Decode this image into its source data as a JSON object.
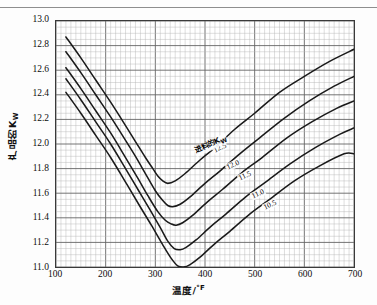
{
  "figure": {
    "yaxis_title": "产品的K",
    "yaxis_title_sub": "W",
    "xaxis_title": "温度/",
    "xaxis_title_unit": "°F",
    "series_header": "进料的K",
    "series_header_sub": "W"
  },
  "chart_data": {
    "type": "line",
    "title": "",
    "xlabel": "温度/°F",
    "ylabel": "产品的K_W",
    "xlim": [
      100,
      700
    ],
    "ylim": [
      11.0,
      13.0
    ],
    "xticks": [
      100,
      200,
      300,
      400,
      500,
      600,
      700
    ],
    "yticks": [
      11.0,
      11.2,
      11.4,
      11.6,
      11.8,
      12.0,
      12.2,
      12.4,
      12.6,
      12.8,
      13.0
    ],
    "xtick_labels": [
      "100",
      "200",
      "300",
      "400",
      "500",
      "600",
      "700"
    ],
    "ytick_labels": [
      "11.0",
      "11.2",
      "11.4",
      "11.6",
      "11.8",
      "12.0",
      "12.2",
      "12.4",
      "12.6",
      "12.8",
      "13.0"
    ],
    "grid": true,
    "grid_minor": true,
    "legend": "inline-labels",
    "legend_title": "进料的K_W",
    "series": [
      {
        "name": "12.5",
        "label": "12.5",
        "color": "#1a1a1a",
        "x": [
          120,
          150,
          180,
          210,
          240,
          260,
          280,
          295,
          305,
          315,
          325,
          340,
          360,
          390,
          420,
          460,
          500,
          550,
          600,
          650,
          700
        ],
        "values": [
          12.87,
          12.7,
          12.52,
          12.34,
          12.15,
          12.02,
          11.89,
          11.8,
          11.74,
          11.7,
          11.68,
          11.7,
          11.76,
          11.87,
          11.97,
          12.12,
          12.25,
          12.42,
          12.55,
          12.67,
          12.77
        ]
      },
      {
        "name": "12.0",
        "label": "12.0",
        "color": "#1a1a1a",
        "x": [
          120,
          150,
          180,
          210,
          240,
          260,
          280,
          300,
          315,
          325,
          335,
          350,
          370,
          400,
          430,
          470,
          510,
          560,
          610,
          660,
          700
        ],
        "values": [
          12.75,
          12.58,
          12.4,
          12.22,
          12.03,
          11.9,
          11.76,
          11.62,
          11.54,
          11.5,
          11.49,
          11.51,
          11.57,
          11.68,
          11.78,
          11.92,
          12.05,
          12.21,
          12.35,
          12.47,
          12.55
        ]
      },
      {
        "name": "11.5",
        "label": "11.5",
        "color": "#1a1a1a",
        "x": [
          120,
          150,
          180,
          210,
          240,
          265,
          285,
          305,
          320,
          332,
          342,
          355,
          375,
          405,
          435,
          475,
          515,
          565,
          615,
          665,
          700
        ],
        "values": [
          12.62,
          12.45,
          12.27,
          12.09,
          11.89,
          11.72,
          11.58,
          11.45,
          11.38,
          11.35,
          11.34,
          11.36,
          11.42,
          11.53,
          11.63,
          11.77,
          11.89,
          12.05,
          12.18,
          12.29,
          12.35
        ]
      },
      {
        "name": "11.0",
        "label": "11.0",
        "color": "#1a1a1a",
        "x": [
          120,
          150,
          180,
          210,
          240,
          265,
          290,
          310,
          325,
          338,
          350,
          362,
          382,
          412,
          442,
          482,
          522,
          572,
          622,
          672,
          700
        ],
        "values": [
          12.53,
          12.36,
          12.18,
          12.0,
          11.8,
          11.63,
          11.46,
          11.32,
          11.21,
          11.15,
          11.14,
          11.16,
          11.22,
          11.33,
          11.43,
          11.57,
          11.69,
          11.84,
          11.97,
          12.08,
          12.13
        ]
      },
      {
        "name": "10.5",
        "label": "10.5",
        "color": "#1a1a1a",
        "x": [
          120,
          150,
          180,
          210,
          240,
          268,
          292,
          315,
          332,
          345,
          357,
          370,
          390,
          420,
          450,
          490,
          530,
          580,
          630,
          680,
          700
        ],
        "values": [
          12.42,
          12.25,
          12.07,
          11.89,
          11.69,
          11.5,
          11.34,
          11.18,
          11.07,
          11.01,
          11.0,
          11.02,
          11.08,
          11.19,
          11.29,
          11.43,
          11.55,
          11.7,
          11.82,
          11.92,
          11.92
        ]
      }
    ]
  }
}
